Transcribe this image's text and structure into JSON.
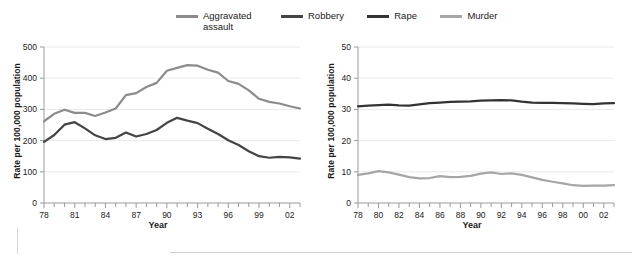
{
  "legend": {
    "items": [
      {
        "label": "Aggravated\nassault",
        "key": "aggravated",
        "color": "#8c8c8c"
      },
      {
        "label": "Robbery",
        "key": "robbery",
        "color": "#444444"
      },
      {
        "label": "Rape",
        "key": "rape",
        "color": "#333333"
      },
      {
        "label": "Murder",
        "key": "murder",
        "color": "#a6a6a6"
      }
    ]
  },
  "chart_data": [
    {
      "id": "left",
      "type": "line",
      "title": "",
      "xlabel": "Year",
      "ylabel": "Rate per 100,000 population",
      "xlim": [
        1978,
        2003
      ],
      "ylim": [
        0,
        500
      ],
      "yticks": [
        0,
        100,
        200,
        300,
        400,
        500
      ],
      "ytick_labels": [
        "0",
        "100",
        "200",
        "300",
        "400",
        "500"
      ],
      "xticks": [
        1978,
        1979,
        1980,
        1981,
        1982,
        1983,
        1984,
        1985,
        1986,
        1987,
        1988,
        1989,
        1990,
        1991,
        1992,
        1993,
        1994,
        1995,
        1996,
        1997,
        1998,
        1999,
        2000,
        2001,
        2002,
        2003
      ],
      "xtick_labels": [
        "78",
        "",
        "",
        "81",
        "",
        "",
        "84",
        "",
        "",
        "87",
        "",
        "",
        "90",
        "",
        "",
        "93",
        "",
        "",
        "96",
        "",
        "",
        "99",
        "",
        "",
        "02",
        ""
      ],
      "grid": true,
      "legend_position": "top",
      "x": [
        1978,
        1979,
        1980,
        1981,
        1982,
        1983,
        1984,
        1985,
        1986,
        1987,
        1988,
        1989,
        1990,
        1991,
        1992,
        1993,
        1994,
        1995,
        1996,
        1997,
        1998,
        1999,
        2000,
        2001,
        2002,
        2003
      ],
      "series": [
        {
          "name": "Aggravated assault",
          "color": "#8c8c8c",
          "values": [
            262,
            286,
            299,
            289,
            289,
            279,
            290,
            303,
            346,
            352,
            372,
            385,
            424,
            433,
            442,
            440,
            427,
            418,
            391,
            382,
            361,
            334,
            324,
            319,
            310,
            303
          ]
        },
        {
          "name": "Robbery",
          "color": "#444444",
          "values": [
            196,
            218,
            251,
            259,
            239,
            217,
            205,
            209,
            226,
            213,
            221,
            234,
            257,
            273,
            264,
            256,
            238,
            221,
            201,
            186,
            166,
            150,
            145,
            148,
            146,
            142
          ]
        }
      ]
    },
    {
      "id": "right",
      "type": "line",
      "title": "",
      "xlabel": "Year",
      "ylabel": "Rate per 100,000 population",
      "xlim": [
        1978,
        2003
      ],
      "ylim": [
        0,
        50
      ],
      "yticks": [
        0,
        10,
        20,
        30,
        40,
        50
      ],
      "ytick_labels": [
        "0",
        "10",
        "20",
        "30",
        "40",
        "50"
      ],
      "xticks": [
        1978,
        1979,
        1980,
        1981,
        1982,
        1983,
        1984,
        1985,
        1986,
        1987,
        1988,
        1989,
        1990,
        1991,
        1992,
        1993,
        1994,
        1995,
        1996,
        1997,
        1998,
        1999,
        2000,
        2001,
        2002,
        2003
      ],
      "xtick_labels": [
        "78",
        "",
        "80",
        "",
        "82",
        "",
        "84",
        "",
        "86",
        "",
        "88",
        "",
        "90",
        "",
        "92",
        "",
        "94",
        "",
        "96",
        "",
        "98",
        "",
        "00",
        "",
        "02",
        ""
      ],
      "grid": true,
      "legend_position": "top",
      "x": [
        1978,
        1979,
        1980,
        1981,
        1982,
        1983,
        1984,
        1985,
        1986,
        1987,
        1988,
        1989,
        1990,
        1991,
        1992,
        1993,
        1994,
        1995,
        1996,
        1997,
        1998,
        1999,
        2000,
        2001,
        2002,
        2003
      ],
      "series": [
        {
          "name": "Rape",
          "color": "#333333",
          "values": [
            31.0,
            31.2,
            31.4,
            31.5,
            31.3,
            31.2,
            31.6,
            32.0,
            32.2,
            32.4,
            32.5,
            32.6,
            32.8,
            32.9,
            33.0,
            32.9,
            32.5,
            32.2,
            32.1,
            32.1,
            32.0,
            31.9,
            31.8,
            31.7,
            31.9,
            32.0
          ]
        },
        {
          "name": "Murder",
          "color": "#a6a6a6",
          "values": [
            9.0,
            9.5,
            10.2,
            9.8,
            9.1,
            8.3,
            7.9,
            8.0,
            8.6,
            8.3,
            8.4,
            8.7,
            9.4,
            9.8,
            9.3,
            9.5,
            9.0,
            8.2,
            7.4,
            6.8,
            6.3,
            5.7,
            5.5,
            5.6,
            5.6,
            5.7
          ]
        }
      ]
    }
  ]
}
